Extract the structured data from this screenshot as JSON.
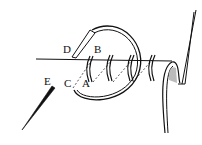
{
  "diagram": {
    "labels": {
      "D": "D",
      "B": "B",
      "E": "E",
      "C": "C",
      "A": "A"
    },
    "colors": {
      "ink": "#111111",
      "background": "#ffffff",
      "shade": "#bbbbbb"
    }
  }
}
